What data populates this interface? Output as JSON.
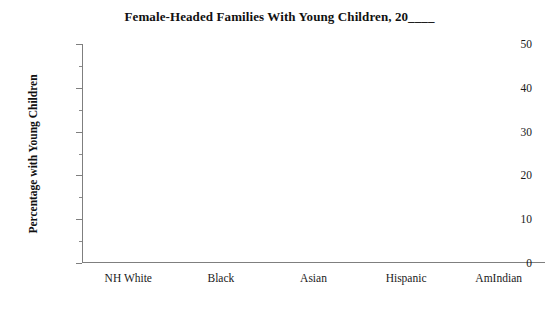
{
  "chart_data": {
    "type": "bar",
    "title": "Female-Headed Families With Young Children, 20____",
    "subtitle": "",
    "xlabel": "",
    "ylabel": "Percentage with Young Children",
    "categories": [
      "NH White",
      "Black",
      "Asian",
      "Hispanic",
      "AmIndian"
    ],
    "values": [
      null,
      null,
      null,
      null,
      null
    ],
    "series": [
      {
        "name": "Percentage with Young Children",
        "values": [
          null,
          null,
          null,
          null,
          null
        ]
      }
    ],
    "ylim": [
      0,
      50
    ],
    "xlim": [
      0,
      5
    ],
    "y_major_ticks": [
      0,
      10,
      20,
      30,
      40,
      50
    ],
    "y_minor_ticks": [
      5,
      15,
      25,
      35,
      45
    ],
    "y_tick_labels": [
      "0",
      "10",
      "20",
      "30",
      "40",
      "50"
    ],
    "grid": false,
    "legend": false,
    "legend_position": "none",
    "note": "Blank worksheet template: axes and labels drawn, no data plotted.",
    "annotations": []
  },
  "figure": {
    "background_color": "#ffffff",
    "axis_color": "#7f7f7f",
    "text_color": "#1a1a1a",
    "title_color": "#111111"
  }
}
